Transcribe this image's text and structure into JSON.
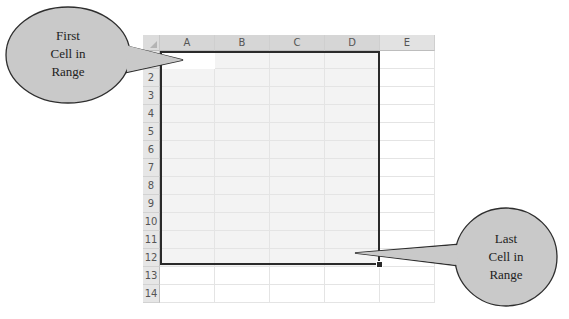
{
  "spreadsheet": {
    "columns": [
      "A",
      "B",
      "C",
      "D",
      "E"
    ],
    "rows": [
      "1",
      "2",
      "3",
      "4",
      "5",
      "6",
      "7",
      "8",
      "9",
      "10",
      "11",
      "12",
      "13",
      "14"
    ],
    "selected_range": "A1:D12"
  },
  "callouts": {
    "first": {
      "line1": "First",
      "line2": "Cell in",
      "line3": "Range"
    },
    "last": {
      "line1": "Last",
      "line2": "Cell in",
      "line3": "Range"
    }
  },
  "colors": {
    "bubble_fill": "#c9c9c9",
    "bubble_stroke": "#2e2e2e",
    "selection_border": "#2a2a2a",
    "selection_fill": "#f3f3f3"
  }
}
